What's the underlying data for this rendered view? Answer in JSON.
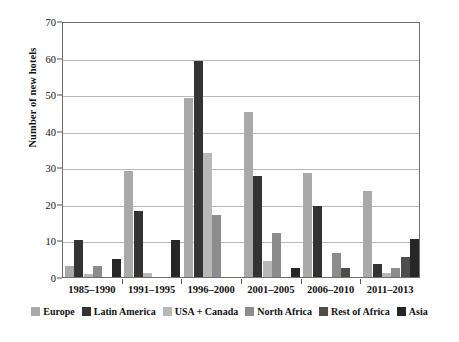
{
  "chart_data": {
    "type": "bar",
    "title": "",
    "subtitle": "",
    "xlabel": "",
    "ylabel": "Number of new hotels",
    "ylim": [
      0,
      70
    ],
    "yticks": [
      0,
      10,
      20,
      30,
      40,
      50,
      60,
      70
    ],
    "grid": true,
    "legend_position": "bottom",
    "categories": [
      "1985–1990",
      "1991–1995",
      "1996–2000",
      "2001–2005",
      "2006–2010",
      "2011–2013"
    ],
    "series": [
      {
        "name": "Europe",
        "color": "#a9a9a9",
        "values": [
          3,
          29,
          49,
          45,
          28.5,
          23.5
        ]
      },
      {
        "name": "Latin America",
        "color": "#333333",
        "values": [
          10,
          18,
          59,
          27.5,
          19.5,
          3.5
        ]
      },
      {
        "name": "USA + Canada",
        "color": "#b8b8b8",
        "values": [
          0.8,
          1,
          34,
          4.5,
          0,
          1
        ]
      },
      {
        "name": "North Africa",
        "color": "#8c8c8c",
        "values": [
          3,
          0,
          17,
          12,
          6.5,
          2.5
        ]
      },
      {
        "name": "Rest of Africa",
        "color": "#4d4d4d",
        "values": [
          0,
          0,
          0,
          0,
          2.5,
          5.5
        ]
      },
      {
        "name": "Asia",
        "color": "#262626",
        "values": [
          5,
          10,
          0,
          2.5,
          0,
          10.5
        ]
      }
    ]
  },
  "axis": {
    "y_title": "Number of new hotels",
    "tick_labels": [
      "70",
      "60",
      "50",
      "40",
      "30",
      "20",
      "10",
      "0"
    ],
    "x_labels": [
      "1985–1990",
      "1991–1995",
      "1996–2000",
      "2001–2005",
      "2006–2010",
      "2011–2013"
    ]
  },
  "legend": {
    "items": [
      {
        "label": "Europe",
        "color": "#a9a9a9"
      },
      {
        "label": "Latin America",
        "color": "#333333"
      },
      {
        "label": "USA + Canada",
        "color": "#b8b8b8"
      },
      {
        "label": "North Africa",
        "color": "#8c8c8c"
      },
      {
        "label": "Rest of Africa",
        "color": "#4d4d4d"
      },
      {
        "label": "Asia",
        "color": "#262626"
      }
    ]
  }
}
